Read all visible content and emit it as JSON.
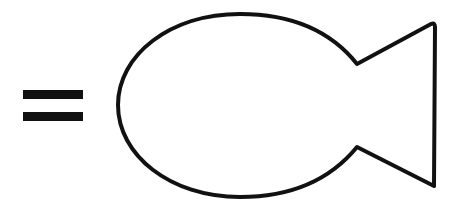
{
  "diagram": {
    "elements": [
      {
        "type": "equals-sign",
        "color": "#111111"
      },
      {
        "type": "fish-outline",
        "stroke": "#111111",
        "fill": "#ffffff",
        "stroke_width": 4
      }
    ]
  }
}
